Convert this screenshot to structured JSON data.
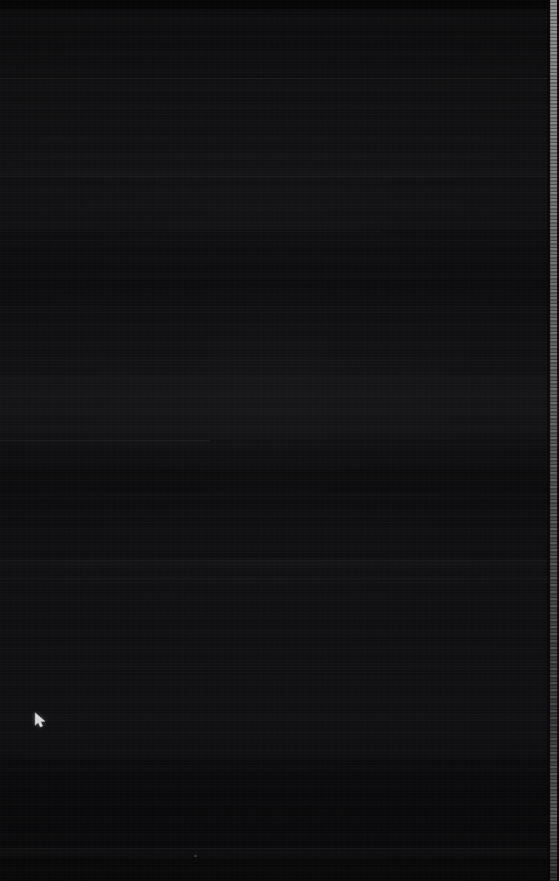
{
  "screen": {
    "width": 559,
    "height": 881,
    "description": "blank-dark-screen",
    "background_color": "#111113",
    "content_text": "",
    "state_label": "no visible content"
  },
  "artifacts": {
    "cursor": {
      "name": "mouse-cursor",
      "glyph": "arrow-pointer",
      "color": "#ffffff",
      "x": 40,
      "y": 719
    },
    "edge_strip": {
      "name": "right-edge-scrollbar",
      "color": "#bcbcbc",
      "x": 550,
      "width": 7,
      "height": 881
    },
    "stray_dot": {
      "name": "faint-dot",
      "color": "#bebebe",
      "x": 195,
      "y": 856
    }
  },
  "bands": [
    {
      "name": "band-top-dark",
      "top": 0,
      "height": 9,
      "color": "rgba(0,0,0,0.55)"
    },
    {
      "name": "band-upper",
      "top": 30,
      "height": 48,
      "color": "rgba(0,0,0,0.12)"
    },
    {
      "name": "band-mid-upper",
      "top": 104,
      "height": 72,
      "color": "rgba(255,255,255,0.012)"
    },
    {
      "name": "band-mid",
      "top": 230,
      "height": 66,
      "color": "rgba(0,0,0,0.14)"
    },
    {
      "name": "band-mid-lower",
      "top": 376,
      "height": 64,
      "color": "rgba(255,255,255,0.010)"
    },
    {
      "name": "band-lower",
      "top": 470,
      "height": 88,
      "color": "rgba(0,0,0,0.13)"
    },
    {
      "name": "band-lower-two",
      "top": 600,
      "height": 70,
      "color": "rgba(255,255,255,0.009)"
    },
    {
      "name": "band-bottom",
      "top": 760,
      "height": 88,
      "color": "rgba(0,0,0,0.15)"
    },
    {
      "name": "band-foot",
      "top": 858,
      "height": 23,
      "color": "rgba(0,0,0,0.30)"
    }
  ],
  "rules": [
    {
      "name": "separator-78",
      "top": 78,
      "left": 0,
      "width": 559,
      "color": "rgba(255,255,255,0.050)"
    },
    {
      "name": "separator-176",
      "top": 176,
      "left": 0,
      "width": 559,
      "color": "rgba(255,255,255,0.055)"
    },
    {
      "name": "separator-231",
      "top": 231,
      "left": 0,
      "width": 380,
      "color": "rgba(255,255,255,0.030)"
    },
    {
      "name": "separator-440",
      "top": 440,
      "left": 0,
      "width": 210,
      "color": "rgba(255,255,255,0.075)"
    },
    {
      "name": "separator-494",
      "top": 494,
      "left": 0,
      "width": 559,
      "color": "rgba(255,255,255,0.028)"
    },
    {
      "name": "separator-560",
      "top": 560,
      "left": 0,
      "width": 559,
      "color": "rgba(255,255,255,0.055)"
    },
    {
      "name": "separator-578",
      "top": 578,
      "left": 0,
      "width": 559,
      "color": "rgba(255,255,255,0.040)"
    },
    {
      "name": "separator-676",
      "top": 676,
      "left": 0,
      "width": 559,
      "color": "rgba(255,255,255,0.026)"
    },
    {
      "name": "separator-848",
      "top": 848,
      "left": 0,
      "width": 559,
      "color": "rgba(255,255,255,0.060)"
    }
  ]
}
